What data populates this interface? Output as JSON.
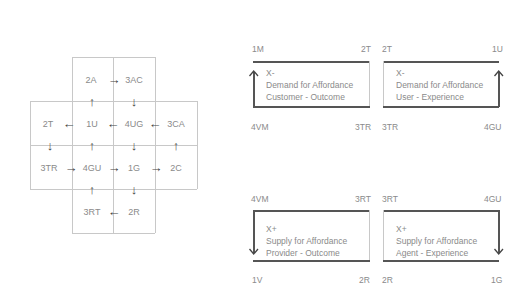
{
  "grid": {
    "cells": [
      {
        "id": "2A",
        "row": 0,
        "col": 1
      },
      {
        "id": "3AC",
        "row": 0,
        "col": 2
      },
      {
        "id": "2T",
        "row": 1,
        "col": 0
      },
      {
        "id": "1U",
        "row": 1,
        "col": 1
      },
      {
        "id": "4UG",
        "row": 1,
        "col": 2
      },
      {
        "id": "3CA",
        "row": 1,
        "col": 3
      },
      {
        "id": "3TR",
        "row": 2,
        "col": 0
      },
      {
        "id": "4GU",
        "row": 2,
        "col": 1
      },
      {
        "id": "1G",
        "row": 2,
        "col": 2
      },
      {
        "id": "2C",
        "row": 2,
        "col": 3
      },
      {
        "id": "3RT",
        "row": 3,
        "col": 1
      },
      {
        "id": "2R",
        "row": 3,
        "col": 2
      }
    ],
    "labels": {
      "c2A": "2A",
      "c3AC": "3AC",
      "c2T": "2T",
      "c1U": "1U",
      "c4UG": "4UG",
      "c3CA": "3CA",
      "c3TR": "3TR",
      "c4GU": "4GU",
      "c1G": "1G",
      "c2C": "2C",
      "c3RT": "3RT",
      "c2R": "2R"
    },
    "arrows": {
      "a2A_3AC": "→",
      "a3AC_4UG": "↓",
      "a1U_2A": "↑",
      "a4UG_1U": "←",
      "a1U_2T": "←",
      "a3CA_4UG": "←",
      "a2T_3TR": "↓",
      "a4GU_1U": "↑",
      "a4UG_1G": "↓",
      "a2C_3CA": "↑",
      "a3TR_4GU": "→",
      "a4GU_1G": "→",
      "a1G_2C": "→",
      "a3RT_4GU": "↑",
      "a1G_2R": "↓",
      "a2R_3RT": "←"
    }
  },
  "quadrants": {
    "q1": {
      "top_left": "1M",
      "top_right": "2T",
      "bottom_left": "4VM",
      "bottom_right": "3TR",
      "line1": "X-",
      "line2": "Demand for Affordance",
      "line3": "Customer - Outcome",
      "arrow": "up-left"
    },
    "q2": {
      "top_left": "2T",
      "top_right": "1U",
      "bottom_left": "3TR",
      "bottom_right": "4GU",
      "line1": "X-",
      "line2": "Demand for Affordance",
      "line3": "User - Experience",
      "arrow": "up-right"
    },
    "q3": {
      "top_left": "4VM",
      "top_right": "3RT",
      "bottom_left": "1V",
      "bottom_right": "2R",
      "line1": "X+",
      "line2": "Supply for Affordance",
      "line3": "Provider - Outcome",
      "arrow": "down-left"
    },
    "q4": {
      "top_left": "3RT",
      "top_right": "4GU",
      "bottom_left": "2R",
      "bottom_right": "1G",
      "line1": "X+",
      "line2": "Supply for Affordance",
      "line3": "Agent - Experience",
      "arrow": "down-right"
    }
  }
}
